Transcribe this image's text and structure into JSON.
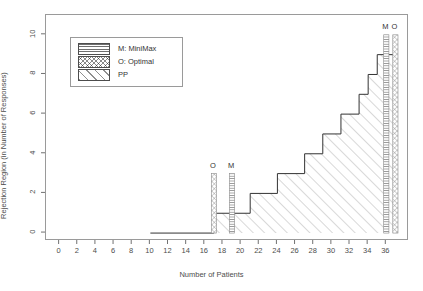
{
  "chart_data": {
    "type": "line",
    "title": "",
    "xlabel": "Number of Patients",
    "ylabel": "Rejection Region (in Number of Responses)",
    "xlim": [
      -1.5,
      38.5
    ],
    "ylim": [
      -0.4,
      11.0
    ],
    "grid": false,
    "legend_position": "top-left",
    "xticks": [
      0,
      2,
      4,
      6,
      8,
      10,
      12,
      14,
      16,
      18,
      20,
      22,
      24,
      26,
      28,
      30,
      32,
      34,
      36
    ],
    "yticks": [
      0,
      2,
      4,
      6,
      8,
      10
    ],
    "legend": [
      {
        "key": "minimax",
        "label": "M: MiniMax",
        "fill": "horizontal-lines"
      },
      {
        "key": "optimal",
        "label": "O: Optimal",
        "fill": "cross-hatch"
      },
      {
        "key": "pp",
        "label": "PP",
        "fill": "diagonal-lines"
      }
    ],
    "series": [
      {
        "name": "PP",
        "type": "step",
        "fill": "diagonal-lines",
        "x": [
          10,
          17,
          21,
          24,
          27,
          29,
          31,
          33,
          34,
          35,
          36,
          37
        ],
        "y": [
          0,
          1,
          2,
          3,
          4,
          5,
          6,
          7,
          8,
          9,
          9,
          9
        ]
      }
    ],
    "bars": [
      {
        "name": "O-left",
        "label": "O",
        "x": 17,
        "value": 3,
        "fill": "cross-hatch"
      },
      {
        "name": "M-left",
        "label": "M",
        "x": 19,
        "value": 3,
        "fill": "horizontal-lines"
      },
      {
        "name": "M-right",
        "label": "M",
        "x": 36,
        "value": 10,
        "fill": "horizontal-lines"
      },
      {
        "name": "O-right",
        "label": "O",
        "x": 37,
        "value": 10,
        "fill": "cross-hatch"
      }
    ],
    "colors": {
      "axis": "#4d4d4d",
      "frame": "#9a9a9a",
      "step_line": "#333333",
      "hatch": "#8f8f8f",
      "background": "#ffffff"
    }
  }
}
